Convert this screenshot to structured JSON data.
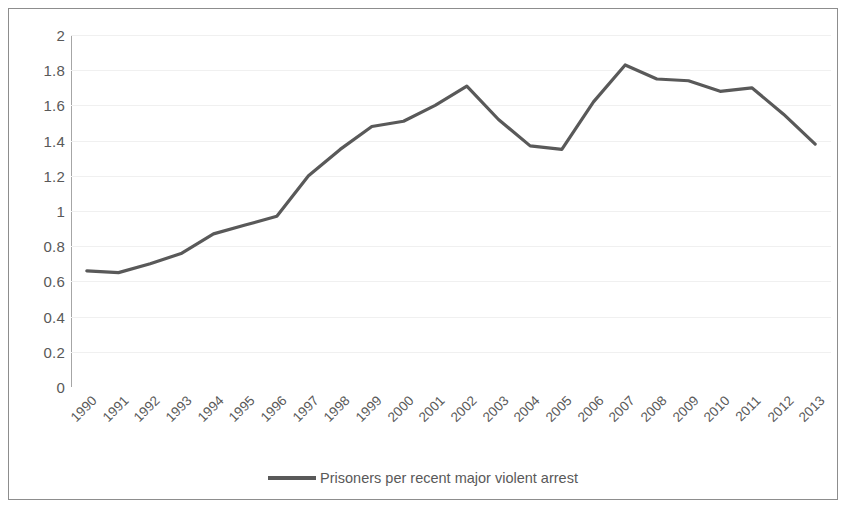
{
  "chart_data": {
    "type": "line",
    "title": "",
    "subtitle": "",
    "xlabel": "",
    "ylabel": "",
    "grid": true,
    "legend_position": "bottom",
    "ylim": [
      0,
      2
    ],
    "y_ticks": [
      "0",
      "0.2",
      "0.4",
      "0.6",
      "0.8",
      "1",
      "1.2",
      "1.4",
      "1.6",
      "1.8",
      "2"
    ],
    "categories": [
      "1990",
      "1991",
      "1992",
      "1993",
      "1994",
      "1995",
      "1996",
      "1997",
      "1998",
      "1999",
      "2000",
      "2001",
      "2002",
      "2003",
      "2004",
      "2005",
      "2006",
      "2007",
      "2008",
      "2009",
      "2010",
      "2011",
      "2012",
      "2013"
    ],
    "series": [
      {
        "name": "Prisoners per recent major violent arrest",
        "color": "#595959",
        "values": [
          0.66,
          0.65,
          0.7,
          0.76,
          0.87,
          0.92,
          0.97,
          1.2,
          1.35,
          1.48,
          1.51,
          1.6,
          1.71,
          1.52,
          1.37,
          1.35,
          1.62,
          1.83,
          1.75,
          1.74,
          1.68,
          1.7,
          1.55,
          1.38
        ]
      }
    ]
  },
  "legend": {
    "entries": [
      {
        "label": "Prisoners per recent major violent arrest",
        "color": "#595959"
      }
    ]
  },
  "colors": {
    "series_line": "#595959",
    "axis": "#a6a6a6",
    "gridline": "#f0f0f0",
    "tick_text": "#595959",
    "frame_border": "#8d8d8d",
    "background": "#ffffff"
  }
}
